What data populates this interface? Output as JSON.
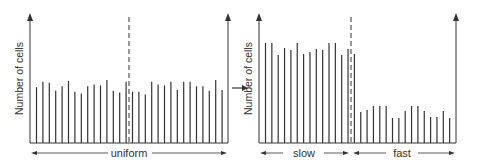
{
  "diagram": {
    "panels": [
      {
        "id": "uniform",
        "ylabel": "Number of cells",
        "xlabels": [
          "uniform"
        ],
        "bars": [
          62,
          68,
          67,
          58,
          63,
          69,
          57,
          55,
          63,
          65,
          64,
          70,
          58,
          56,
          68,
          57,
          57,
          54,
          68,
          65,
          64,
          68,
          59,
          68,
          68,
          63,
          63,
          58,
          70,
          59
        ],
        "dashed_divider_index": 14.5
      },
      {
        "id": "slow-fast",
        "ylabel": "Number of cells",
        "xlabels": [
          "slow",
          "fast"
        ],
        "bars": [
          100,
          100,
          88,
          95,
          93,
          100,
          89,
          91,
          94,
          93,
          100,
          100,
          88,
          94,
          89,
          31,
          33,
          37,
          37,
          37,
          25,
          25,
          32,
          37,
          37,
          32,
          26,
          26,
          32,
          25
        ],
        "dashed_divider_index": 14.5
      }
    ],
    "arrow_between_panels": "right-arrow"
  },
  "colors": {
    "line": "#333333",
    "background": "#ffffff"
  }
}
